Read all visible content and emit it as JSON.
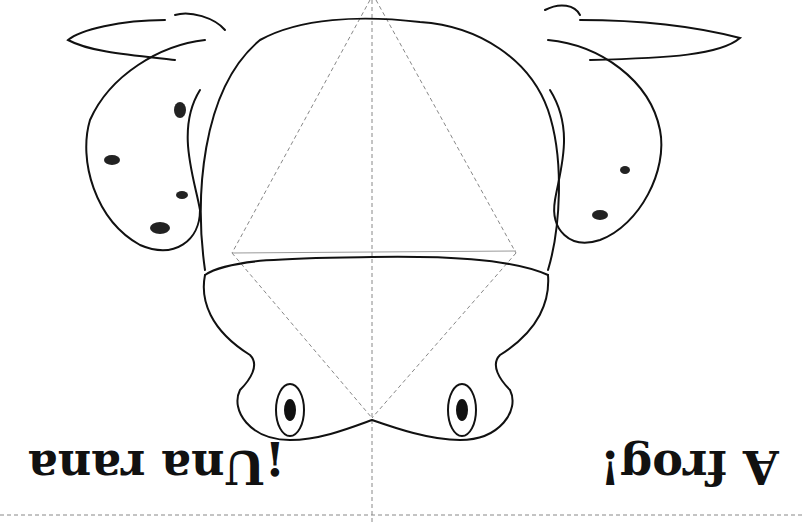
{
  "card": {
    "caption_spanish": "¡Una rana",
    "caption_english": "A frog!",
    "orientation": "upside-down",
    "illustration": "frog-line-drawing",
    "fold_guides": "dashed",
    "colors": {
      "ink": "#111111",
      "paper": "#ffffff",
      "guide": "#888888"
    }
  }
}
